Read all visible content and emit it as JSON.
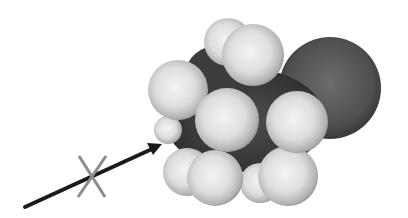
{
  "figure": {
    "colors": {
      "background": "#ffffff",
      "hydrogen_light": "#f2f2f2",
      "hydrogen_mid": "#c8c8c8",
      "hydrogen_edge": "#8a8a8a",
      "carbon_body": "#3a3a3a",
      "halogen_light": "#6a6a6a",
      "halogen_dark": "#2e2e2e",
      "arrow": "#1a1a1a",
      "x_mark": "#8c8c8c"
    },
    "arrow": {
      "x1": 25,
      "y1": 207,
      "x2": 160,
      "y2": 145
    },
    "x_mark": {
      "cx": 93,
      "cy": 178,
      "size": 18
    },
    "labels": {
      "x_mark_symbol": "X"
    }
  }
}
